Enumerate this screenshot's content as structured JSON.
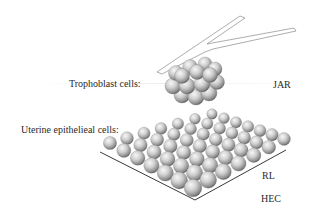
{
  "diagram": {
    "trophoblast": {
      "label": "Trophoblast cells:",
      "cell_lines": [
        "JAR"
      ]
    },
    "uterine": {
      "label": "Uterine epithelieal cells:",
      "cell_lines": [
        "RL",
        "HEC"
      ]
    },
    "colors": {
      "text": "#2a2a2a",
      "sphere_light": "#f4f4f4",
      "sphere_mid": "#bdbdbd",
      "sphere_dark": "#6e6e6e",
      "pipette_stroke": "#8a8a8a",
      "sheet_edge": "#3a3a3a"
    }
  }
}
